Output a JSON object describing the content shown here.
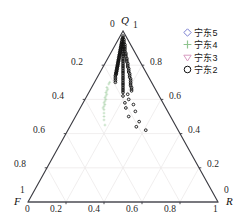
{
  "chart_data": {
    "type": "scatter",
    "plot_kind": "ternary",
    "title": "",
    "axes": {
      "top": {
        "name": "Q",
        "corner_left_value": "0",
        "corner_right_value": "1"
      },
      "left": {
        "name": "F",
        "corner_top_value": "1",
        "corner_bottom_value": "0"
      },
      "right": {
        "name": "R",
        "corner_top_value": "0",
        "corner_bottom_value": "1"
      }
    },
    "tick_values": [
      0,
      0.2,
      0.4,
      0.6,
      0.8,
      1
    ],
    "bottom_ticks": [
      "0",
      "0.2",
      "0.4",
      "0.6",
      "0.8",
      "1"
    ],
    "left_ticks": [
      "0.2",
      "0.4",
      "0.6",
      "0.8"
    ],
    "right_ticks": [
      "0.8",
      "0.6",
      "0.4",
      "0.2"
    ],
    "grid": true,
    "grid_color": "#eceaea",
    "axis_color": "#3b3b42",
    "legend_position": "top-right",
    "series": [
      {
        "name": "宁东5",
        "marker": "diamond-open",
        "color": "#7b7fd0",
        "points": []
      },
      {
        "name": "宁东4",
        "marker": "plus",
        "color": "#8fc48f",
        "points": [
          {
            "Q": 0.7,
            "F": 0.22,
            "R": 0.08
          },
          {
            "Q": 0.69,
            "F": 0.23,
            "R": 0.08
          },
          {
            "Q": 0.67,
            "F": 0.25,
            "R": 0.08
          },
          {
            "Q": 0.66,
            "F": 0.25,
            "R": 0.09
          },
          {
            "Q": 0.65,
            "F": 0.26,
            "R": 0.09
          },
          {
            "Q": 0.64,
            "F": 0.27,
            "R": 0.09
          },
          {
            "Q": 0.63,
            "F": 0.27,
            "R": 0.1
          },
          {
            "Q": 0.62,
            "F": 0.28,
            "R": 0.1
          },
          {
            "Q": 0.61,
            "F": 0.29,
            "R": 0.1
          },
          {
            "Q": 0.6,
            "F": 0.29,
            "R": 0.11
          },
          {
            "Q": 0.59,
            "F": 0.3,
            "R": 0.11
          },
          {
            "Q": 0.58,
            "F": 0.31,
            "R": 0.11
          },
          {
            "Q": 0.57,
            "F": 0.31,
            "R": 0.12
          },
          {
            "Q": 0.56,
            "F": 0.32,
            "R": 0.12
          },
          {
            "Q": 0.55,
            "F": 0.33,
            "R": 0.12
          },
          {
            "Q": 0.54,
            "F": 0.33,
            "R": 0.13
          },
          {
            "Q": 0.52,
            "F": 0.34,
            "R": 0.14
          },
          {
            "Q": 0.5,
            "F": 0.35,
            "R": 0.15
          },
          {
            "Q": 0.48,
            "F": 0.36,
            "R": 0.16
          },
          {
            "Q": 0.45,
            "F": 0.37,
            "R": 0.18
          }
        ]
      },
      {
        "name": "宁东3",
        "marker": "triangle-down-open",
        "color": "#d79ac0",
        "points": []
      },
      {
        "name": "宁东2",
        "marker": "circle-open",
        "color": "#101010",
        "points": [
          {
            "Q": 0.97,
            "F": 0.015,
            "R": 0.015
          },
          {
            "Q": 0.96,
            "F": 0.02,
            "R": 0.02
          },
          {
            "Q": 0.955,
            "F": 0.025,
            "R": 0.02
          },
          {
            "Q": 0.95,
            "F": 0.03,
            "R": 0.02
          },
          {
            "Q": 0.95,
            "F": 0.02,
            "R": 0.03
          },
          {
            "Q": 0.94,
            "F": 0.035,
            "R": 0.025
          },
          {
            "Q": 0.94,
            "F": 0.025,
            "R": 0.035
          },
          {
            "Q": 0.935,
            "F": 0.04,
            "R": 0.025
          },
          {
            "Q": 0.93,
            "F": 0.04,
            "R": 0.03
          },
          {
            "Q": 0.93,
            "F": 0.03,
            "R": 0.04
          },
          {
            "Q": 0.925,
            "F": 0.045,
            "R": 0.03
          },
          {
            "Q": 0.92,
            "F": 0.05,
            "R": 0.03
          },
          {
            "Q": 0.92,
            "F": 0.04,
            "R": 0.04
          },
          {
            "Q": 0.92,
            "F": 0.03,
            "R": 0.05
          },
          {
            "Q": 0.915,
            "F": 0.05,
            "R": 0.035
          },
          {
            "Q": 0.91,
            "F": 0.055,
            "R": 0.035
          },
          {
            "Q": 0.91,
            "F": 0.045,
            "R": 0.045
          },
          {
            "Q": 0.91,
            "F": 0.035,
            "R": 0.055
          },
          {
            "Q": 0.905,
            "F": 0.06,
            "R": 0.035
          },
          {
            "Q": 0.9,
            "F": 0.06,
            "R": 0.04
          },
          {
            "Q": 0.9,
            "F": 0.05,
            "R": 0.05
          },
          {
            "Q": 0.9,
            "F": 0.04,
            "R": 0.06
          },
          {
            "Q": 0.895,
            "F": 0.065,
            "R": 0.04
          },
          {
            "Q": 0.89,
            "F": 0.07,
            "R": 0.04
          },
          {
            "Q": 0.89,
            "F": 0.055,
            "R": 0.055
          },
          {
            "Q": 0.89,
            "F": 0.045,
            "R": 0.065
          },
          {
            "Q": 0.885,
            "F": 0.07,
            "R": 0.045
          },
          {
            "Q": 0.88,
            "F": 0.075,
            "R": 0.045
          },
          {
            "Q": 0.88,
            "F": 0.06,
            "R": 0.06
          },
          {
            "Q": 0.88,
            "F": 0.05,
            "R": 0.07
          },
          {
            "Q": 0.875,
            "F": 0.08,
            "R": 0.045
          },
          {
            "Q": 0.87,
            "F": 0.08,
            "R": 0.05
          },
          {
            "Q": 0.87,
            "F": 0.065,
            "R": 0.065
          },
          {
            "Q": 0.87,
            "F": 0.05,
            "R": 0.08
          },
          {
            "Q": 0.865,
            "F": 0.085,
            "R": 0.05
          },
          {
            "Q": 0.86,
            "F": 0.09,
            "R": 0.05
          },
          {
            "Q": 0.86,
            "F": 0.07,
            "R": 0.07
          },
          {
            "Q": 0.86,
            "F": 0.055,
            "R": 0.085
          },
          {
            "Q": 0.855,
            "F": 0.09,
            "R": 0.055
          },
          {
            "Q": 0.85,
            "F": 0.095,
            "R": 0.055
          },
          {
            "Q": 0.85,
            "F": 0.075,
            "R": 0.075
          },
          {
            "Q": 0.85,
            "F": 0.06,
            "R": 0.09
          },
          {
            "Q": 0.845,
            "F": 0.1,
            "R": 0.055
          },
          {
            "Q": 0.84,
            "F": 0.1,
            "R": 0.06
          },
          {
            "Q": 0.84,
            "F": 0.08,
            "R": 0.08
          },
          {
            "Q": 0.84,
            "F": 0.06,
            "R": 0.1
          },
          {
            "Q": 0.835,
            "F": 0.105,
            "R": 0.06
          },
          {
            "Q": 0.83,
            "F": 0.11,
            "R": 0.06
          },
          {
            "Q": 0.83,
            "F": 0.085,
            "R": 0.085
          },
          {
            "Q": 0.83,
            "F": 0.065,
            "R": 0.105
          },
          {
            "Q": 0.825,
            "F": 0.11,
            "R": 0.065
          },
          {
            "Q": 0.82,
            "F": 0.115,
            "R": 0.065
          },
          {
            "Q": 0.82,
            "F": 0.09,
            "R": 0.09
          },
          {
            "Q": 0.82,
            "F": 0.07,
            "R": 0.11
          },
          {
            "Q": 0.815,
            "F": 0.12,
            "R": 0.065
          },
          {
            "Q": 0.81,
            "F": 0.12,
            "R": 0.07
          },
          {
            "Q": 0.81,
            "F": 0.095,
            "R": 0.095
          },
          {
            "Q": 0.81,
            "F": 0.07,
            "R": 0.12
          },
          {
            "Q": 0.805,
            "F": 0.125,
            "R": 0.07
          },
          {
            "Q": 0.8,
            "F": 0.13,
            "R": 0.07
          },
          {
            "Q": 0.8,
            "F": 0.1,
            "R": 0.1
          },
          {
            "Q": 0.8,
            "F": 0.075,
            "R": 0.125
          },
          {
            "Q": 0.795,
            "F": 0.13,
            "R": 0.075
          },
          {
            "Q": 0.79,
            "F": 0.135,
            "R": 0.075
          },
          {
            "Q": 0.79,
            "F": 0.105,
            "R": 0.105
          },
          {
            "Q": 0.79,
            "F": 0.08,
            "R": 0.13
          },
          {
            "Q": 0.785,
            "F": 0.14,
            "R": 0.075
          },
          {
            "Q": 0.78,
            "F": 0.14,
            "R": 0.08
          },
          {
            "Q": 0.78,
            "F": 0.11,
            "R": 0.11
          },
          {
            "Q": 0.78,
            "F": 0.08,
            "R": 0.14
          },
          {
            "Q": 0.775,
            "F": 0.145,
            "R": 0.08
          },
          {
            "Q": 0.77,
            "F": 0.15,
            "R": 0.08
          },
          {
            "Q": 0.77,
            "F": 0.115,
            "R": 0.115
          },
          {
            "Q": 0.77,
            "F": 0.085,
            "R": 0.145
          },
          {
            "Q": 0.765,
            "F": 0.15,
            "R": 0.085
          },
          {
            "Q": 0.76,
            "F": 0.155,
            "R": 0.085
          },
          {
            "Q": 0.76,
            "F": 0.12,
            "R": 0.12
          },
          {
            "Q": 0.76,
            "F": 0.09,
            "R": 0.15
          },
          {
            "Q": 0.755,
            "F": 0.16,
            "R": 0.085
          },
          {
            "Q": 0.75,
            "F": 0.16,
            "R": 0.09
          },
          {
            "Q": 0.75,
            "F": 0.125,
            "R": 0.125
          },
          {
            "Q": 0.75,
            "F": 0.09,
            "R": 0.16
          },
          {
            "Q": 0.745,
            "F": 0.165,
            "R": 0.09
          },
          {
            "Q": 0.74,
            "F": 0.17,
            "R": 0.09
          },
          {
            "Q": 0.74,
            "F": 0.13,
            "R": 0.13
          },
          {
            "Q": 0.74,
            "F": 0.095,
            "R": 0.165
          },
          {
            "Q": 0.73,
            "F": 0.175,
            "R": 0.095
          },
          {
            "Q": 0.73,
            "F": 0.135,
            "R": 0.135
          },
          {
            "Q": 0.73,
            "F": 0.1,
            "R": 0.17
          },
          {
            "Q": 0.72,
            "F": 0.18,
            "R": 0.1
          },
          {
            "Q": 0.72,
            "F": 0.14,
            "R": 0.14
          },
          {
            "Q": 0.72,
            "F": 0.1,
            "R": 0.18
          },
          {
            "Q": 0.71,
            "F": 0.185,
            "R": 0.105
          },
          {
            "Q": 0.71,
            "F": 0.145,
            "R": 0.145
          },
          {
            "Q": 0.71,
            "F": 0.105,
            "R": 0.185
          },
          {
            "Q": 0.7,
            "F": 0.19,
            "R": 0.11
          },
          {
            "Q": 0.7,
            "F": 0.15,
            "R": 0.15
          },
          {
            "Q": 0.7,
            "F": 0.11,
            "R": 0.19
          },
          {
            "Q": 0.69,
            "F": 0.155,
            "R": 0.155
          },
          {
            "Q": 0.69,
            "F": 0.115,
            "R": 0.195
          },
          {
            "Q": 0.68,
            "F": 0.16,
            "R": 0.16
          },
          {
            "Q": 0.68,
            "F": 0.12,
            "R": 0.2
          },
          {
            "Q": 0.67,
            "F": 0.165,
            "R": 0.165
          },
          {
            "Q": 0.67,
            "F": 0.12,
            "R": 0.21
          },
          {
            "Q": 0.66,
            "F": 0.17,
            "R": 0.17
          },
          {
            "Q": 0.66,
            "F": 0.125,
            "R": 0.215
          },
          {
            "Q": 0.65,
            "F": 0.175,
            "R": 0.175
          },
          {
            "Q": 0.65,
            "F": 0.13,
            "R": 0.22
          },
          {
            "Q": 0.64,
            "F": 0.18,
            "R": 0.18
          },
          {
            "Q": 0.63,
            "F": 0.16,
            "R": 0.21
          },
          {
            "Q": 0.62,
            "F": 0.19,
            "R": 0.19
          },
          {
            "Q": 0.6,
            "F": 0.17,
            "R": 0.23
          },
          {
            "Q": 0.58,
            "F": 0.2,
            "R": 0.22
          },
          {
            "Q": 0.57,
            "F": 0.16,
            "R": 0.27
          },
          {
            "Q": 0.55,
            "F": 0.21,
            "R": 0.24
          },
          {
            "Q": 0.53,
            "F": 0.17,
            "R": 0.3
          },
          {
            "Q": 0.5,
            "F": 0.22,
            "R": 0.28
          },
          {
            "Q": 0.47,
            "F": 0.18,
            "R": 0.35
          },
          {
            "Q": 0.44,
            "F": 0.21,
            "R": 0.35
          },
          {
            "Q": 0.42,
            "F": 0.17,
            "R": 0.41
          }
        ]
      }
    ]
  },
  "legend": {
    "entries": [
      {
        "label": "宁东5"
      },
      {
        "label": "宁东4"
      },
      {
        "label": "宁东3"
      },
      {
        "label": "宁东2"
      }
    ]
  },
  "labels": {
    "apex_q": "Q",
    "apex_q_left_value": "0",
    "apex_q_right_value": "1",
    "corner_f": "F",
    "corner_f_top_value": "1",
    "corner_f_bottom_value": "0",
    "corner_r": "R",
    "corner_r_top_value": "0",
    "corner_r_bottom_value": "1",
    "bottom_ticks": [
      "0.2",
      "0.4",
      "0.6",
      "0.8"
    ],
    "left_ticks": [
      "0.2",
      "0.4",
      "0.6",
      "0.8"
    ],
    "right_ticks": [
      "0.8",
      "0.6",
      "0.4",
      "0.2"
    ]
  }
}
